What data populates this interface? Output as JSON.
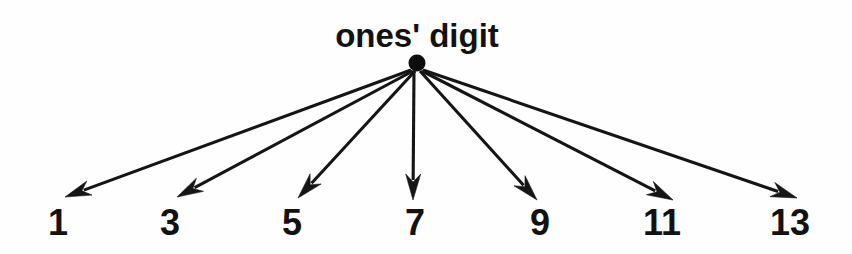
{
  "figure": {
    "type": "radial-tree-diagram",
    "background_color": "#fefefe",
    "ink_color": "#151515",
    "title": "ones' digit",
    "title_position": {
      "x": 417,
      "y": 47
    },
    "hub": {
      "name": "ones-digit-hub",
      "cx": 417,
      "cy": 63,
      "r": 8.5,
      "color": "#0d0d0d"
    },
    "branches": [
      {
        "label": "1",
        "label_x": 58,
        "label_y": 235,
        "tip_x": 65,
        "tip_y": 197,
        "start_x": 411,
        "start_y": 70
      },
      {
        "label": "3",
        "label_x": 170,
        "label_y": 235,
        "tip_x": 177,
        "tip_y": 197,
        "start_x": 413,
        "start_y": 71
      },
      {
        "label": "5",
        "label_x": 292,
        "label_y": 235,
        "tip_x": 298,
        "tip_y": 198,
        "start_x": 415,
        "start_y": 71
      },
      {
        "label": "7",
        "label_x": 415,
        "label_y": 235,
        "tip_x": 413,
        "tip_y": 200,
        "start_x": 414,
        "start_y": 71
      },
      {
        "label": "9",
        "label_x": 540,
        "label_y": 235,
        "tip_x": 537,
        "tip_y": 200,
        "start_x": 420,
        "start_y": 71
      },
      {
        "label": "11",
        "label_x": 662,
        "label_y": 235,
        "tip_x": 673,
        "tip_y": 200,
        "start_x": 422,
        "start_y": 71
      },
      {
        "label": "13",
        "label_x": 790,
        "label_y": 235,
        "tip_x": 797,
        "tip_y": 198,
        "start_x": 423,
        "start_y": 70
      }
    ]
  }
}
